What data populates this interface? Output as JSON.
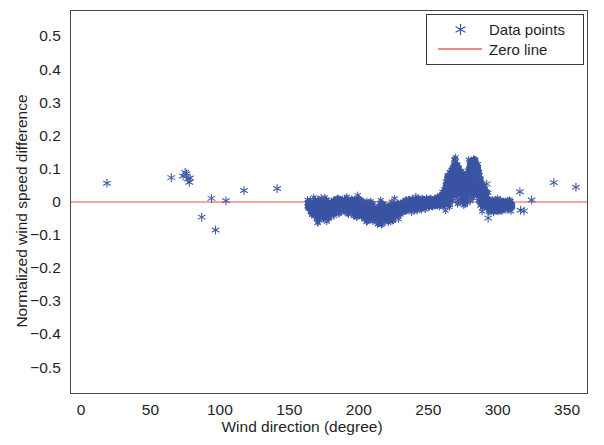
{
  "figure": {
    "background": "#ffffff",
    "frame_color": "#4a4a4a"
  },
  "axis": {
    "x_title": "Wind direction (degree)",
    "y_title": "Normalized wind speed difference",
    "x_ticks": [
      "0",
      "50",
      "100",
      "150",
      "200",
      "250",
      "300",
      "350"
    ],
    "y_ticks": [
      "0.5",
      "0.4",
      "0.3",
      "0.2",
      "0.1",
      "0",
      "-0.1",
      "-0.2",
      "-0.3",
      "-0.4",
      "-0.5"
    ]
  },
  "legend": {
    "position": "top-right",
    "entries": [
      {
        "label": "Data points",
        "marker": "asterisk-marker-icon",
        "color": "#3b55a4"
      },
      {
        "label": "Zero line",
        "marker": "line-swatch-icon",
        "color": "#f08a80"
      }
    ]
  },
  "chart_data": {
    "type": "scatter",
    "title": "",
    "subtitle": "",
    "xlabel": "Wind direction (degree)",
    "ylabel": "Normalized wind speed difference",
    "xlim": [
      -8,
      365
    ],
    "ylim": [
      -0.58,
      0.58
    ],
    "x_ticks": [
      0,
      50,
      100,
      150,
      200,
      250,
      300,
      350
    ],
    "y_ticks": [
      -0.5,
      -0.4,
      -0.3,
      -0.2,
      -0.1,
      0,
      0.1,
      0.2,
      0.3,
      0.4,
      0.5
    ],
    "grid": false,
    "legend_position": "upper right",
    "marker": "asterisk",
    "marker_color": "#3b55a4",
    "marker_size": 5,
    "reference_lines": [
      {
        "name": "Zero line",
        "orientation": "horizontal",
        "y": 0,
        "color": "#f08a80",
        "width": 1.6
      }
    ],
    "series": [
      {
        "name": "Data points",
        "color": "#3b55a4",
        "sparse_points": [
          [
            18.0,
            0.057
          ],
          [
            64.5,
            0.074
          ],
          [
            73.0,
            0.079
          ],
          [
            74.5,
            0.09
          ],
          [
            75.5,
            0.086
          ],
          [
            76.5,
            0.07
          ],
          [
            77.5,
            0.06
          ],
          [
            78.0,
            0.073
          ],
          [
            86.5,
            -0.046
          ],
          [
            93.5,
            0.011
          ],
          [
            96.5,
            -0.085
          ],
          [
            104.0,
            0.004
          ],
          [
            117.0,
            0.035
          ],
          [
            141.0,
            0.041
          ],
          [
            292.5,
            0.055
          ],
          [
            293.5,
            -0.049
          ],
          [
            316.5,
            0.031
          ],
          [
            317.0,
            -0.025
          ],
          [
            319.5,
            -0.027
          ],
          [
            325.0,
            0.006
          ],
          [
            341.0,
            0.059
          ],
          [
            357.0,
            0.045
          ]
        ],
        "dense_band": {
          "description": "Dense cluster of thousands of points hugging the zero line from about 163 to 311 degrees",
          "x_range": [
            163,
            311
          ],
          "profile": [
            {
              "x": 163,
              "center": -0.006,
              "spread": 0.012
            },
            {
              "x": 167,
              "center": -0.018,
              "spread": 0.026
            },
            {
              "x": 172,
              "center": -0.026,
              "spread": 0.034
            },
            {
              "x": 177,
              "center": -0.024,
              "spread": 0.032
            },
            {
              "x": 182,
              "center": -0.014,
              "spread": 0.024
            },
            {
              "x": 187,
              "center": -0.01,
              "spread": 0.018
            },
            {
              "x": 192,
              "center": -0.012,
              "spread": 0.022
            },
            {
              "x": 197,
              "center": -0.016,
              "spread": 0.026
            },
            {
              "x": 202,
              "center": -0.02,
              "spread": 0.028
            },
            {
              "x": 207,
              "center": -0.028,
              "spread": 0.03
            },
            {
              "x": 212,
              "center": -0.034,
              "spread": 0.03
            },
            {
              "x": 217,
              "center": -0.036,
              "spread": 0.03
            },
            {
              "x": 222,
              "center": -0.032,
              "spread": 0.028
            },
            {
              "x": 227,
              "center": -0.022,
              "spread": 0.026
            },
            {
              "x": 232,
              "center": -0.014,
              "spread": 0.022
            },
            {
              "x": 237,
              "center": -0.008,
              "spread": 0.02
            },
            {
              "x": 242,
              "center": -0.006,
              "spread": 0.018
            },
            {
              "x": 247,
              "center": -0.004,
              "spread": 0.016
            },
            {
              "x": 252,
              "center": -0.002,
              "spread": 0.014
            },
            {
              "x": 257,
              "center": 0.002,
              "spread": 0.016
            },
            {
              "x": 262,
              "center": 0.012,
              "spread": 0.028
            },
            {
              "x": 266,
              "center": 0.04,
              "spread": 0.046
            },
            {
              "x": 270,
              "center": 0.05,
              "spread": 0.05
            },
            {
              "x": 274,
              "center": 0.044,
              "spread": 0.046
            },
            {
              "x": 278,
              "center": 0.052,
              "spread": 0.05
            },
            {
              "x": 282,
              "center": 0.062,
              "spread": 0.05
            },
            {
              "x": 286,
              "center": 0.048,
              "spread": 0.044
            },
            {
              "x": 290,
              "center": 0.016,
              "spread": 0.034
            },
            {
              "x": 294,
              "center": -0.012,
              "spread": 0.024
            },
            {
              "x": 298,
              "center": -0.014,
              "spread": 0.02
            },
            {
              "x": 302,
              "center": -0.012,
              "spread": 0.018
            },
            {
              "x": 306,
              "center": -0.01,
              "spread": 0.016
            },
            {
              "x": 311,
              "center": -0.008,
              "spread": 0.012
            }
          ],
          "upper_lobe": {
            "description": "Elevated arc of points rising above the band between 260 and 292 degrees, peaking near 0.13",
            "points": [
              [
                261.0,
                0.018
              ],
              [
                262.0,
                0.03
              ],
              [
                263.0,
                0.046
              ],
              [
                263.5,
                0.062
              ],
              [
                264.0,
                0.072
              ],
              [
                264.5,
                0.058
              ],
              [
                265.0,
                0.08
              ],
              [
                265.5,
                0.066
              ],
              [
                266.0,
                0.09
              ],
              [
                266.5,
                0.074
              ],
              [
                267.0,
                0.098
              ],
              [
                267.5,
                0.084
              ],
              [
                268.0,
                0.106
              ],
              [
                268.5,
                0.092
              ],
              [
                269.0,
                0.118
              ],
              [
                269.5,
                0.1
              ],
              [
                270.0,
                0.124
              ],
              [
                270.5,
                0.108
              ],
              [
                271.0,
                0.112
              ],
              [
                271.5,
                0.096
              ],
              [
                272.0,
                0.104
              ],
              [
                272.5,
                0.088
              ],
              [
                273.0,
                0.094
              ],
              [
                273.5,
                0.078
              ],
              [
                274.0,
                0.086
              ],
              [
                275.0,
                0.07
              ],
              [
                276.0,
                0.078
              ],
              [
                277.0,
                0.062
              ],
              [
                278.0,
                0.072
              ],
              [
                279.0,
                0.086
              ],
              [
                280.0,
                0.1
              ],
              [
                280.5,
                0.112
              ],
              [
                281.0,
                0.12
              ],
              [
                281.5,
                0.108
              ],
              [
                282.0,
                0.126
              ],
              [
                282.5,
                0.116
              ],
              [
                283.0,
                0.132
              ],
              [
                283.5,
                0.118
              ],
              [
                284.0,
                0.122
              ],
              [
                284.5,
                0.11
              ],
              [
                285.0,
                0.114
              ],
              [
                285.5,
                0.1
              ],
              [
                286.0,
                0.104
              ],
              [
                286.5,
                0.09
              ],
              [
                287.0,
                0.082
              ],
              [
                288.0,
                0.068
              ],
              [
                289.0,
                0.056
              ],
              [
                290.0,
                0.044
              ],
              [
                291.0,
                0.036
              ],
              [
                292.0,
                0.028
              ]
            ]
          }
        }
      }
    ]
  }
}
